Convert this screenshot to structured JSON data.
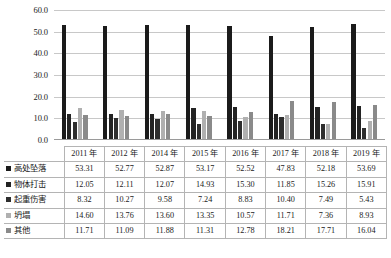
{
  "chart_data": {
    "type": "bar",
    "title": "",
    "subtitle": "",
    "xlabel": "",
    "ylabel": "",
    "ylim": [
      0,
      60
    ],
    "ytick_step": 10,
    "ytick_labels": [
      "0.0",
      "10.0",
      "20.0",
      "30.0",
      "40.0",
      "50.0",
      "60.0"
    ],
    "grid": true,
    "legend_position": "table-row-headers",
    "categories": [
      "2011 年",
      "2012 年",
      "2014 年",
      "2015 年",
      "2016 年",
      "2017 年",
      "2018 年",
      "2019 年"
    ],
    "series": [
      {
        "name": "高处坠落",
        "color": "#1b1b1b",
        "values": [
          53.31,
          52.77,
          52.87,
          53.17,
          52.52,
          47.83,
          52.18,
          53.69
        ]
      },
      {
        "name": "物体打击",
        "color": "#232323",
        "values": [
          12.05,
          12.11,
          12.07,
          14.93,
          15.3,
          11.85,
          15.26,
          15.91
        ]
      },
      {
        "name": "起重伤害",
        "color": "#2e2e2e",
        "values": [
          8.32,
          10.27,
          9.58,
          7.24,
          8.83,
          10.4,
          7.49,
          5.43
        ]
      },
      {
        "name": "坍塌",
        "color": "#b0b0b0",
        "values": [
          14.6,
          13.76,
          13.6,
          13.35,
          10.57,
          11.71,
          7.36,
          8.93
        ]
      },
      {
        "name": "其他",
        "color": "#8a8a8a",
        "values": [
          11.71,
          11.09,
          11.88,
          11.31,
          12.78,
          18.21,
          17.71,
          16.04
        ]
      }
    ]
  },
  "table": {
    "header_corner": "",
    "columns": [
      "2011 年",
      "2012 年",
      "2014 年",
      "2015 年",
      "2016 年",
      "2017 年",
      "2018 年",
      "2019 年"
    ],
    "rows": [
      {
        "label": "高处坠落",
        "values": [
          "53.31",
          "52.77",
          "52.87",
          "53.17",
          "52.52",
          "47.83",
          "52.18",
          "53.69"
        ]
      },
      {
        "label": "物体打击",
        "values": [
          "12.05",
          "12.11",
          "12.07",
          "14.93",
          "15.30",
          "11.85",
          "15.26",
          "15.91"
        ]
      },
      {
        "label": "起重伤害",
        "values": [
          "8.32",
          "10.27",
          "9.58",
          "7.24",
          "8.83",
          "10.40",
          "7.49",
          "5.43"
        ]
      },
      {
        "label": "坍塌",
        "values": [
          "14.60",
          "13.76",
          "13.60",
          "13.35",
          "10.57",
          "11.71",
          "7.36",
          "8.93"
        ]
      },
      {
        "label": "其他",
        "values": [
          "11.71",
          "11.09",
          "11.88",
          "11.31",
          "12.78",
          "18.21",
          "17.71",
          "16.04"
        ]
      }
    ]
  }
}
